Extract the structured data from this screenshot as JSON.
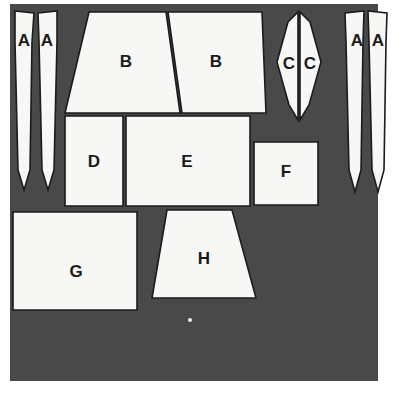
{
  "figure": {
    "colors": {
      "fabric": "#4a4a4a",
      "piece_fill": "#f7f7f5",
      "outline": "#1b1b1b",
      "background": "#ffffff",
      "label_text": "#1b1b1b"
    },
    "fabric_panel": {
      "x": 10,
      "y": 4,
      "width": 368,
      "height": 377
    },
    "pieces": [
      {
        "id": "A-left-outer",
        "label": "A",
        "shape": "tapered-blade",
        "label_x": 24,
        "label_y": 42,
        "points": "15,11 34,13 32,42 30,170 24,190 18,170 15,42"
      },
      {
        "id": "A-left-inner",
        "label": "A",
        "shape": "tapered-blade",
        "label_x": 47,
        "label_y": 42,
        "points": "38,13 57,11 57,42 54,170 48,190 42,170 39,42"
      },
      {
        "id": "B-left",
        "label": "B",
        "shape": "trapezoid",
        "label_x": 126,
        "label_y": 63,
        "points": "89,12 166,12 180,113 65,113"
      },
      {
        "id": "B-right",
        "label": "B",
        "shape": "trapezoid",
        "label_x": 216,
        "label_y": 63,
        "points": "168,12 262,12 266,113 182,113"
      },
      {
        "id": "C-left",
        "label": "C",
        "shape": "half-lens",
        "label_x": 289,
        "label_y": 65,
        "points": "298,12 298,120 289,105 277,62 288,22"
      },
      {
        "id": "C-right",
        "label": "C",
        "shape": "half-lens",
        "label_x": 310,
        "label_y": 65,
        "points": "300,12 310,22 321,62 309,105 300,120"
      },
      {
        "id": "A-right-outer",
        "label": "A",
        "shape": "tapered-blade",
        "label_x": 357,
        "label_y": 42,
        "points": "345,13 364,11 363,42 361,170 355,192 349,170 346,42"
      },
      {
        "id": "A-right-inner",
        "label": "A",
        "shape": "tapered-blade",
        "label_x": 378,
        "label_y": 42,
        "points": "368,11 387,13 386,42 384,170 378,192 372,170 369,42"
      },
      {
        "id": "D",
        "label": "D",
        "shape": "rectangle",
        "label_x": 94,
        "label_y": 163,
        "points": "65,116 123,116 123,206 65,206"
      },
      {
        "id": "E",
        "label": "E",
        "shape": "rectangle",
        "label_x": 187,
        "label_y": 163,
        "points": "126,116 250,116 250,206 126,206"
      },
      {
        "id": "F",
        "label": "F",
        "shape": "rectangle",
        "label_x": 286,
        "label_y": 173,
        "points": "254,142 318,142 318,205 254,205"
      },
      {
        "id": "G",
        "label": "G",
        "shape": "rectangle",
        "label_x": 76,
        "label_y": 273,
        "points": "13,212 137,212 137,310 13,310"
      },
      {
        "id": "H",
        "label": "H",
        "shape": "trapezoid",
        "label_x": 204,
        "label_y": 260,
        "points": "167,210 232,210 256,298 152,298"
      }
    ],
    "artifacts": [
      {
        "id": "speck",
        "shape": "dot",
        "x": 190,
        "y": 320,
        "r": 2
      }
    ]
  }
}
